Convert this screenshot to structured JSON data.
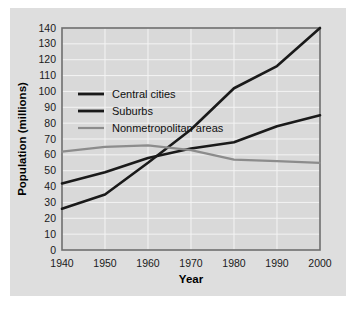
{
  "chart_data": {
    "type": "line",
    "title": "",
    "xlabel": "Year",
    "ylabel": "Population (millions)",
    "xlim": [
      1940,
      2000
    ],
    "ylim": [
      0,
      140
    ],
    "grid": true,
    "legend_position": "upper-left-inside",
    "x": [
      1940,
      1950,
      1960,
      1970,
      1980,
      1990,
      2000
    ],
    "xticks": [
      "1940",
      "1950",
      "1960",
      "1970",
      "1980",
      "1990",
      "2000"
    ],
    "yticks": [
      "0",
      "10",
      "20",
      "30",
      "40",
      "50",
      "60",
      "70",
      "80",
      "90",
      "100",
      "110",
      "120",
      "130",
      "140"
    ],
    "series": [
      {
        "name": "Central cities",
        "color": "#1a1a1a",
        "width": 2.6,
        "values": [
          42,
          49,
          58,
          64,
          68,
          78,
          85
        ]
      },
      {
        "name": "Suburbs",
        "color": "#1a1a1a",
        "width": 2.6,
        "values": [
          26,
          35,
          55,
          76,
          102,
          116,
          140
        ]
      },
      {
        "name": "Nonmetropolitan areas",
        "color": "#8c8c8c",
        "width": 2.2,
        "values": [
          62,
          65,
          66,
          63,
          57,
          56,
          55
        ]
      }
    ]
  },
  "legend": {
    "items": [
      {
        "label": "Central cities",
        "color": "#1a1a1a"
      },
      {
        "label": "Suburbs",
        "color": "#1a1a1a"
      },
      {
        "label": "Nonmetropolitan areas",
        "color": "#8c8c8c"
      }
    ]
  },
  "axes": {
    "x_title": "Year",
    "y_title": "Population (millions)"
  },
  "colors": {
    "figure_background": "#dedede",
    "plot_background": "#d9d9d9",
    "gridline": "#f4f4f4",
    "frame": "#6e6e6e",
    "page": "#ffffff"
  }
}
